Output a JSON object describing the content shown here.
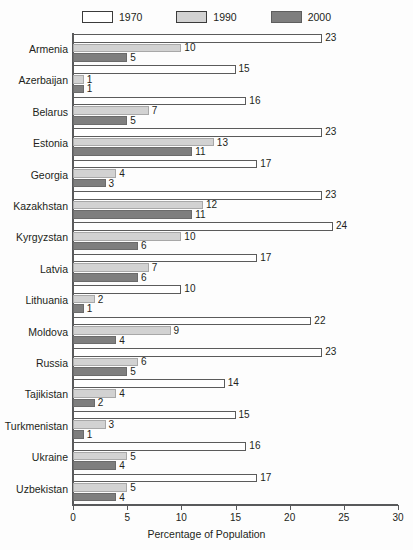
{
  "legend": {
    "items": [
      {
        "label": "1970",
        "color": "#ffffff",
        "name": "legend-1970"
      },
      {
        "label": "1990",
        "color": "#d2d2d2",
        "name": "legend-1990"
      },
      {
        "label": "2000",
        "color": "#7e7e7e",
        "name": "legend-2000"
      }
    ]
  },
  "axis": {
    "xlabel": "Percentage of Population",
    "ticks": [
      "0",
      "5",
      "10",
      "15",
      "20",
      "25",
      "30"
    ]
  },
  "chart_data": {
    "type": "bar",
    "orientation": "horizontal",
    "title": "",
    "xlabel": "Percentage of Population",
    "ylabel": "",
    "xlim": [
      0,
      30
    ],
    "xticks": [
      0,
      5,
      10,
      15,
      20,
      25,
      30
    ],
    "grid": false,
    "legend_position": "top-center",
    "categories": [
      "Armenia",
      "Azerbaijan",
      "Belarus",
      "Estonia",
      "Georgia",
      "Kazakhstan",
      "Kyrgyzstan",
      "Latvia",
      "Lithuania",
      "Moldova",
      "Russia",
      "Tajikistan",
      "Turkmenistan",
      "Ukraine",
      "Uzbekistan"
    ],
    "series": [
      {
        "name": "1970",
        "color": "#ffffff",
        "values": [
          23,
          15,
          16,
          23,
          17,
          23,
          24,
          17,
          10,
          22,
          23,
          14,
          15,
          16,
          17
        ]
      },
      {
        "name": "1990",
        "color": "#d2d2d2",
        "values": [
          10,
          1,
          7,
          13,
          4,
          12,
          10,
          7,
          2,
          9,
          6,
          4,
          3,
          5,
          5
        ]
      },
      {
        "name": "2000",
        "color": "#7e7e7e",
        "values": [
          5,
          1,
          5,
          11,
          3,
          11,
          6,
          6,
          1,
          4,
          5,
          2,
          1,
          4,
          4
        ]
      }
    ]
  }
}
